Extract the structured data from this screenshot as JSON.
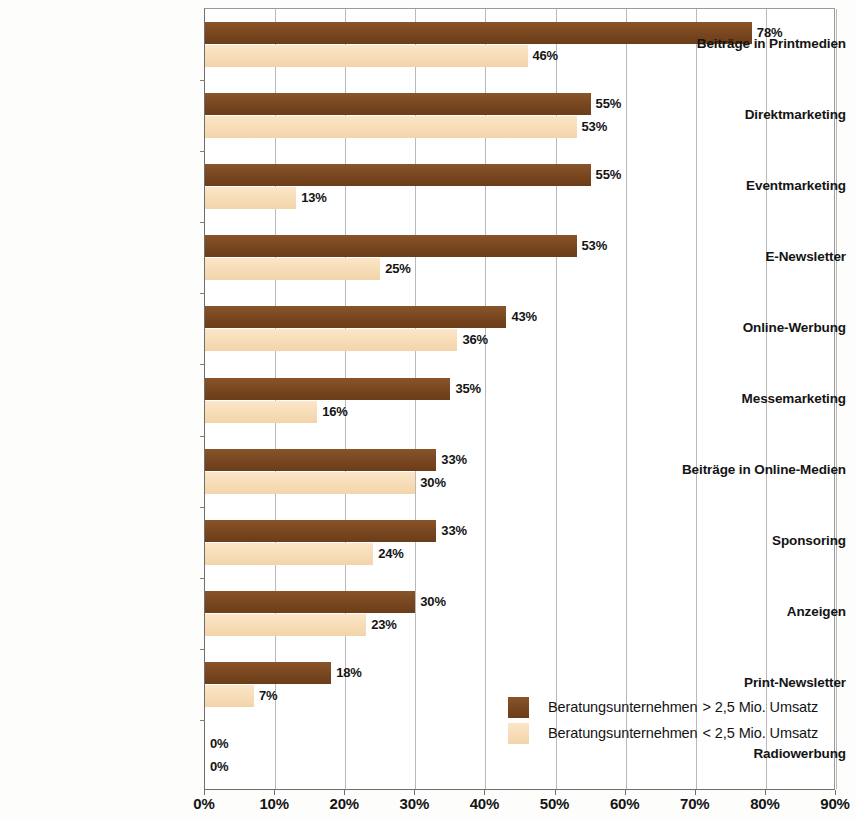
{
  "chart_data": {
    "type": "bar",
    "orientation": "horizontal",
    "title": "",
    "subtitle": "",
    "xlabel": "",
    "ylabel": "",
    "xlim": [
      0,
      90
    ],
    "xtick_step": 10,
    "grid": true,
    "legend_position": "inside-bottom-right",
    "value_suffix": "%",
    "categories": [
      "Beiträge in Printmedien",
      "Direktmarketing",
      "Eventmarketing",
      "E-Newsletter",
      "Online-Werbung",
      "Messemarketing",
      "Beiträge in Online-Medien",
      "Sponsoring",
      "Anzeigen",
      "Print-Newsletter",
      "Radiowerbung"
    ],
    "xticklabels": [
      "0%",
      "10%",
      "20%",
      "30%",
      "40%",
      "50%",
      "60%",
      "70%",
      "80%",
      "90%"
    ],
    "series": [
      {
        "name": "Beratungsunternehmen  > 2,5 Mio. Umsatz",
        "color": "#7a4821",
        "values": [
          78,
          55,
          55,
          53,
          43,
          35,
          33,
          33,
          30,
          18,
          0
        ],
        "value_labels": [
          "78%",
          "55%",
          "55%",
          "53%",
          "43%",
          "35%",
          "33%",
          "33%",
          "30%",
          "18%",
          "0%"
        ]
      },
      {
        "name": "Beratungsunternehmen  < 2,5 Mio. Umsatz",
        "color": "#f7ddb8",
        "values": [
          46,
          53,
          13,
          25,
          36,
          16,
          30,
          24,
          23,
          7,
          0
        ],
        "value_labels": [
          "46%",
          "53%",
          "13%",
          "25%",
          "36%",
          "16%",
          "30%",
          "24%",
          "23%",
          "7%",
          "0%"
        ]
      }
    ]
  },
  "legend": {
    "items": [
      {
        "label_base": "Beratungsunternehmen",
        "label_comparator": "> 2,5 Mio. Umsatz",
        "swatch": "high"
      },
      {
        "label_base": "Beratungsunternehmen",
        "label_comparator": "< 2,5 Mio. Umsatz",
        "swatch": "low"
      }
    ]
  }
}
